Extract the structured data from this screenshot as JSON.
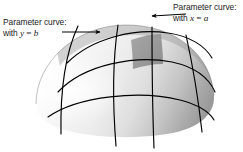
{
  "figure": {
    "name": "parametric-surface-dome",
    "background_color": "#ffffff",
    "curve_color": "#000000",
    "surface": {
      "highlight_color": "#f4f4f4",
      "midtone_color": "#d2d2d2",
      "shadow_color": "#9b9b9b",
      "patch_color": "#8f8f8f",
      "outline_color": "#3a3a3a"
    }
  },
  "labels": {
    "left": {
      "line1": "Parameter curve:",
      "line2_prefix": "with ",
      "line2_var": "y",
      "line2_eq": " = ",
      "line2_val": "b"
    },
    "right": {
      "line1": "Parameter curve:",
      "line2_prefix": "with ",
      "line2_var": "x",
      "line2_eq": " = ",
      "line2_val": "a"
    }
  },
  "annotations": {
    "left_arrow": "arrow pointing right toward the dome surface",
    "right_arrow": "arrow pointing left toward the top of the dome"
  }
}
